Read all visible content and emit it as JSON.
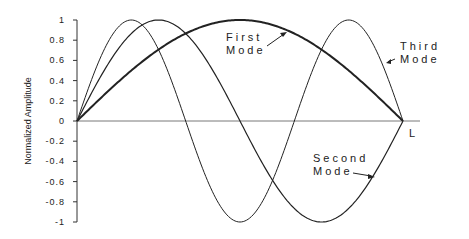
{
  "chart_data": {
    "type": "line",
    "title": "",
    "xlabel": "",
    "ylabel": "Normalized Amplitude",
    "ylim": [
      -1,
      1
    ],
    "xlim": [
      0,
      1
    ],
    "x_end_label": "L",
    "yticks": [
      "1",
      "0.8",
      "0.6",
      "0.4",
      "0.2",
      "0",
      "-0.2",
      "-0.4",
      "-0.6",
      "-0.8",
      "-1"
    ],
    "grid": false,
    "legend": "none (inline annotations)",
    "series": [
      {
        "name": "First Mode",
        "function": "sin(pi*x/L)",
        "x": [
          0,
          0.25,
          0.5,
          0.75,
          1
        ],
        "values": [
          0,
          0.707,
          1,
          0.707,
          0
        ]
      },
      {
        "name": "Second Mode",
        "function": "sin(2*pi*x/L)",
        "x": [
          0,
          0.25,
          0.5,
          0.75,
          1
        ],
        "values": [
          0,
          1,
          0,
          -1,
          0
        ]
      },
      {
        "name": "Third Mode",
        "function": "sin(3*pi*x/L)",
        "x": [
          0,
          0.1667,
          0.3333,
          0.5,
          0.6667,
          0.8333,
          1
        ],
        "values": [
          0,
          1,
          0,
          -1,
          0,
          1,
          0
        ]
      }
    ],
    "annotations": [
      {
        "text": [
          "First",
          "Mode"
        ],
        "target": "First Mode"
      },
      {
        "text": [
          "Third",
          "Mode"
        ],
        "target": "Third Mode"
      },
      {
        "text": [
          "Second",
          "Mode"
        ],
        "target": "Second Mode"
      }
    ]
  },
  "labels": {
    "ylabel": "Normalized Amplitude",
    "x_end": "L",
    "first_1": "First",
    "first_2": "Mode",
    "third_1": "Third",
    "third_2": "Mode",
    "second_1": "Second",
    "second_2": "Mode",
    "ticks": [
      "1",
      "0.8",
      "0.6",
      "0.4",
      "0.2",
      "0",
      "-0.2",
      "-0.4",
      "-0.6",
      "-0.8",
      "-1"
    ]
  }
}
